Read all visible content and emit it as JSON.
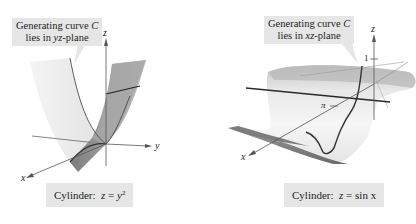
{
  "figures": [
    {
      "id": "parabolic-cylinder",
      "callout": {
        "line1_prefix": "Generating curve ",
        "line1_var": "C",
        "line2_prefix": "lies in ",
        "line2_plane": "yz",
        "line2_suffix": "-plane"
      },
      "axes": {
        "x": "x",
        "y": "y",
        "z": "z"
      },
      "caption": {
        "label": "Cylinder:",
        "lhs": "z",
        "eq": " = ",
        "rhs_base": "y",
        "rhs_exp": "2"
      }
    },
    {
      "id": "sine-cylinder",
      "callout": {
        "line1_prefix": "Generating curve ",
        "line1_var": "C",
        "line2_prefix": "lies in ",
        "line2_plane": "xz",
        "line2_suffix": "-plane"
      },
      "axes": {
        "x": "x",
        "z": "z"
      },
      "ticks": {
        "z_one": "1",
        "x_pi": "π"
      },
      "caption": {
        "label": "Cylinder:",
        "lhs": "z",
        "eq": " = ",
        "rhs": "sin x"
      }
    }
  ],
  "colors": {
    "callout_bg": "#e6e6e6",
    "surface_light": "#efefef",
    "surface_mid": "#c8c8c8",
    "surface_dark": "#8c8c8c",
    "curve": "#3a3a3a",
    "axis": "#555555"
  }
}
